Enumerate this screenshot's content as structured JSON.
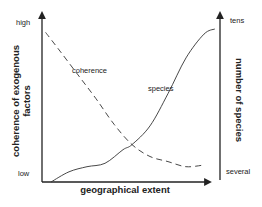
{
  "chart_data": {
    "type": "line",
    "title": "",
    "xlabel": "geographical extent",
    "ylabel_left": "coherence of exogenous factors",
    "ylabel_right": "number of species",
    "left_axis_ticks": {
      "top": "high",
      "bottom": "low"
    },
    "right_axis_ticks": {
      "top": "tens",
      "bottom": "several"
    },
    "xlim": [
      0,
      1
    ],
    "ylim": [
      0,
      1
    ],
    "grid": false,
    "legend": "none (curves labeled inline)",
    "series": [
      {
        "name": "coherence",
        "style": "dashed",
        "axis": "left",
        "x": [
          0.02,
          0.1,
          0.2,
          0.3,
          0.4,
          0.5,
          0.6,
          0.7,
          0.8,
          0.9
        ],
        "y": [
          0.88,
          0.77,
          0.63,
          0.49,
          0.34,
          0.22,
          0.15,
          0.12,
          0.09,
          0.1
        ]
      },
      {
        "name": "species",
        "style": "solid",
        "axis": "right",
        "x": [
          0.05,
          0.15,
          0.25,
          0.35,
          0.45,
          0.5,
          0.6,
          0.7,
          0.8,
          0.9,
          0.96
        ],
        "y": [
          0.0,
          0.06,
          0.09,
          0.11,
          0.19,
          0.22,
          0.33,
          0.52,
          0.73,
          0.87,
          0.9
        ]
      }
    ],
    "annotations": [
      {
        "text": "coherence",
        "near_series": "coherence"
      },
      {
        "text": "species",
        "near_series": "species"
      }
    ]
  }
}
